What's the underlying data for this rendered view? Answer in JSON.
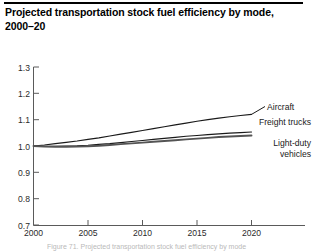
{
  "figure": {
    "title": "Projected transportation stock fuel efficiency by mode,\n2000–20",
    "title_line1": "Projected transportation stock fuel efficiency by mode,",
    "title_line2": "2000–20",
    "caption_partial": "Figure 71. Projected transportation stock fuel efficiency by mode"
  },
  "chart_data": {
    "type": "line",
    "title": "Projected transportation stock fuel efficiency by mode, 2000–20",
    "xlabel": "",
    "ylabel": "",
    "xlim": [
      2000,
      2020
    ],
    "ylim": [
      0.7,
      1.3
    ],
    "grid": false,
    "legend_position": "inline-right-labels",
    "x_ticks": [
      2000,
      2005,
      2010,
      2015,
      2020
    ],
    "x_tick_labels": [
      "2000",
      "2005",
      "2010",
      "2015",
      "2020"
    ],
    "y_ticks": [
      0.7,
      0.8,
      0.9,
      1.0,
      1.1,
      1.2,
      1.3
    ],
    "y_tick_labels": [
      "0.7",
      "0.8",
      "0.9",
      "1.0",
      "1.1",
      "1.2",
      "1.3"
    ],
    "x": [
      2000,
      2001,
      2002,
      2003,
      2004,
      2005,
      2006,
      2007,
      2008,
      2009,
      2010,
      2011,
      2012,
      2013,
      2014,
      2015,
      2016,
      2017,
      2018,
      2019,
      2020
    ],
    "series": [
      {
        "name": "Aircraft",
        "color": "#1a1a1a",
        "values": [
          1.0,
          1.004,
          1.009,
          1.014,
          1.019,
          1.025,
          1.031,
          1.038,
          1.045,
          1.052,
          1.059,
          1.066,
          1.073,
          1.08,
          1.087,
          1.094,
          1.1,
          1.106,
          1.111,
          1.116,
          1.12
        ]
      },
      {
        "name": "Freight trucks",
        "color": "#1a1a1a",
        "values": [
          1.0,
          0.999,
          0.999,
          1.0,
          1.001,
          1.003,
          1.006,
          1.009,
          1.013,
          1.017,
          1.021,
          1.025,
          1.029,
          1.033,
          1.037,
          1.04,
          1.043,
          1.046,
          1.049,
          1.051,
          1.053
        ]
      },
      {
        "name": "Light-duty vehicles",
        "color": "#545454",
        "values": [
          1.0,
          0.998,
          0.997,
          0.997,
          0.998,
          0.999,
          1.001,
          1.004,
          1.007,
          1.01,
          1.013,
          1.016,
          1.019,
          1.022,
          1.025,
          1.028,
          1.031,
          1.034,
          1.036,
          1.038,
          1.04
        ]
      }
    ],
    "annotations": [
      {
        "text": "Aircraft",
        "for": "Aircraft",
        "at_x": 2020,
        "at_y": 1.12
      },
      {
        "text": "Freight trucks",
        "for": "Freight trucks",
        "at_x": 2020,
        "at_y": 1.053
      },
      {
        "text": "Light-duty vehicles",
        "for": "Light-duty vehicles",
        "at_x": 2020,
        "at_y": 1.04
      }
    ]
  },
  "labels": {
    "aircraft": "Aircraft",
    "freight_trucks": "Freight trucks",
    "light_duty_line1": "Light-duty",
    "light_duty_line2": "vehicles"
  }
}
